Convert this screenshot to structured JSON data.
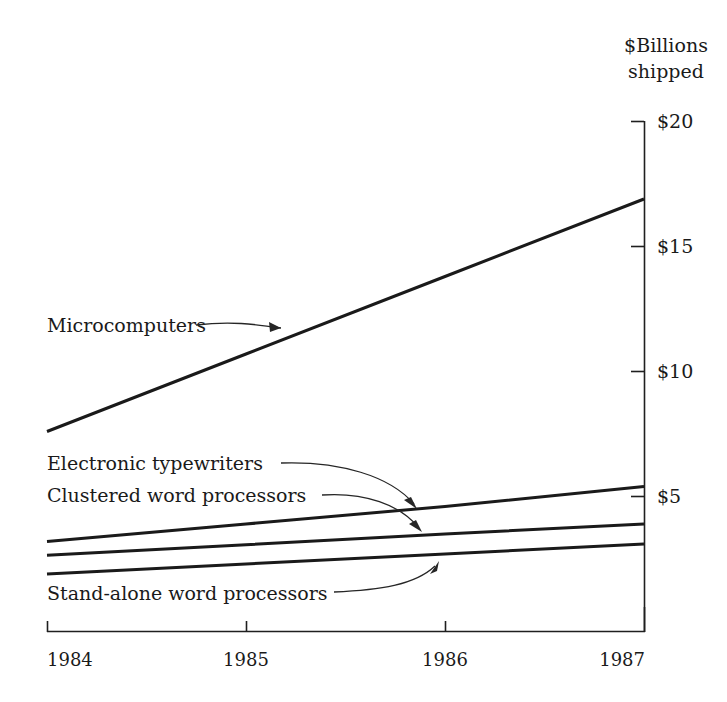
{
  "chart_data": {
    "type": "line",
    "title": "$Billions shipped",
    "title_lines": [
      "$Billions",
      "shipped"
    ],
    "xlabel": "",
    "ylabel": "$Billions shipped",
    "x": [
      1984,
      1985,
      1986,
      1987
    ],
    "xticklabels": [
      "1984",
      "1985",
      "1986",
      "1987"
    ],
    "yticklabels": [
      "$20",
      "$15",
      "$10",
      "$5"
    ],
    "ytickvalues": [
      20,
      15,
      10,
      5
    ],
    "xlim": [
      1984,
      1987
    ],
    "ylim": [
      1.3,
      20
    ],
    "grid": false,
    "legend_position": "inline-annotations",
    "series": [
      {
        "name": "Microcomputers",
        "label": "Microcomputers",
        "values": [
          7.6,
          10.7,
          13.8,
          16.9
        ]
      },
      {
        "name": "Electronic typewriters",
        "label": "Electronic typewriters",
        "values": [
          3.2,
          3.9,
          4.6,
          5.4
        ]
      },
      {
        "name": "Clustered word processors",
        "label": "Clustered word processors",
        "values": [
          2.65,
          3.07,
          3.5,
          3.9
        ]
      },
      {
        "name": "Stand-alone word processors",
        "label": "Stand-alone word processors",
        "values": [
          1.9,
          2.3,
          2.7,
          3.1
        ]
      }
    ]
  },
  "chart": {
    "title_line1": "$Billions",
    "title_line2": "shipped",
    "y_ticks": {
      "t20": "$20",
      "t15": "$15",
      "t10": "$10",
      "t5": "$5"
    },
    "x_ticks": {
      "x1984": "1984",
      "x1985": "1985",
      "x1986": "1986",
      "x1987": "1987"
    },
    "annotations": {
      "micro": "Microcomputers",
      "electronic": "Electronic typewriters",
      "clustered": "Clustered word processors",
      "standalone": "Stand-alone word processors"
    },
    "colors": {
      "line": "#1a1a1a",
      "axis": "#1f1f1f",
      "background": "#ffffff",
      "text": "#1a1a1a"
    }
  }
}
